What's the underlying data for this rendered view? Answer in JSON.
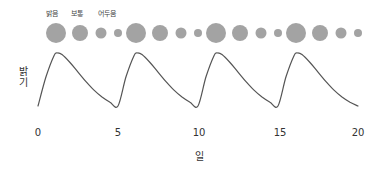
{
  "chart_data": {
    "type": "line",
    "title": "",
    "xlabel": "일",
    "ylabel": "밝기",
    "xlim": [
      0,
      20
    ],
    "x_ticks": [
      0,
      5,
      10,
      15,
      20
    ],
    "x_tick_labels": [
      "0",
      "5",
      "10",
      "15",
      "20"
    ],
    "grid": false,
    "legend": null,
    "period_days": 5,
    "series": [
      {
        "name": "밝기",
        "x": [
          0,
          0.5,
          1.0,
          1.2,
          1.5,
          2.0,
          2.5,
          3.0,
          3.5,
          4.0,
          4.5,
          5.0,
          5.5,
          6.0,
          6.2,
          6.5,
          7.0,
          7.5,
          8.0,
          8.5,
          9.0,
          9.5,
          10.0,
          10.5,
          11.0,
          11.2,
          11.5,
          12.0,
          12.5,
          13.0,
          13.5,
          14.0,
          14.5,
          15.0,
          15.5,
          16.0,
          16.2,
          16.5,
          17.0,
          17.5,
          18.0,
          18.5,
          19.0,
          19.5,
          20.0
        ],
        "y": [
          0.0,
          0.55,
          0.95,
          1.0,
          0.97,
          0.82,
          0.64,
          0.46,
          0.3,
          0.17,
          0.07,
          0.0,
          0.55,
          0.95,
          1.0,
          0.97,
          0.82,
          0.64,
          0.46,
          0.3,
          0.17,
          0.07,
          0.0,
          0.55,
          0.95,
          1.0,
          0.97,
          0.82,
          0.64,
          0.46,
          0.3,
          0.17,
          0.07,
          0.0,
          0.55,
          0.95,
          1.0,
          0.97,
          0.82,
          0.64,
          0.46,
          0.3,
          0.17,
          0.07,
          0.0
        ]
      }
    ],
    "annotations": {
      "phase_labels": [
        "밝음",
        "보통",
        "어두움"
      ],
      "phase_circles": [
        {
          "phase": "밝음",
          "size": "large"
        },
        {
          "phase": "보통",
          "size": "medium"
        },
        {
          "phase": "어두움",
          "size": "small"
        },
        {
          "phase": "어두움",
          "size": "smallest"
        },
        {
          "phase": "밝음",
          "size": "large"
        },
        {
          "phase": "보통",
          "size": "medium"
        },
        {
          "phase": "어두움",
          "size": "small"
        },
        {
          "phase": "어두움",
          "size": "smallest"
        },
        {
          "phase": "밝음",
          "size": "large"
        },
        {
          "phase": "보통",
          "size": "medium"
        },
        {
          "phase": "어두움",
          "size": "small"
        },
        {
          "phase": "어두움",
          "size": "smallest"
        },
        {
          "phase": "밝음",
          "size": "large"
        },
        {
          "phase": "보통",
          "size": "medium"
        },
        {
          "phase": "어두움",
          "size": "small"
        },
        {
          "phase": "어두움",
          "size": "smallest"
        }
      ]
    }
  },
  "labels": {
    "bright": "밝음",
    "normal": "보통",
    "dark": "어두움",
    "x_axis": "일",
    "y_axis": "밝기",
    "ticks": [
      "0",
      "5",
      "10",
      "15",
      "20"
    ]
  },
  "colors": {
    "curve": "#555555",
    "circles": "#a3a3a3",
    "text": "#333333"
  }
}
